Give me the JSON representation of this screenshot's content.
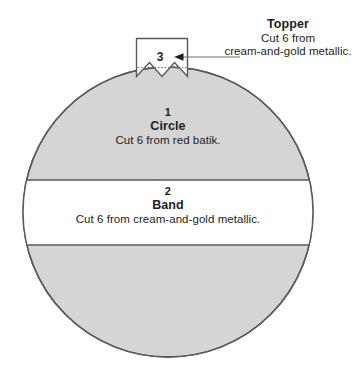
{
  "diagram": {
    "type": "sewing-pattern-cutting-diagram",
    "colors": {
      "piece_fill_gray": "#d5d5d5",
      "piece_fill_white": "#ffffff",
      "outline": "#58595b",
      "text": "#231f20",
      "leader_line": "#6d6e71"
    },
    "pieces": [
      {
        "id": "circle",
        "number": "1",
        "title": "Circle",
        "description": "Cut 6 from red batik."
      },
      {
        "id": "band",
        "number": "2",
        "title": "Band",
        "description": "Cut 6 from cream-and-gold metallic."
      },
      {
        "id": "topper",
        "number": "3",
        "title": "Topper",
        "description_line1": "Cut 6 from",
        "description_line2": "cream-and-gold metallic."
      }
    ]
  }
}
